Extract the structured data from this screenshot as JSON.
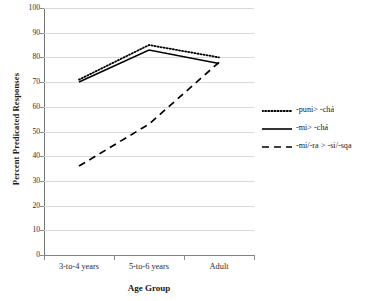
{
  "chart_data": {
    "type": "line",
    "title": "",
    "xlabel": "Age Group",
    "ylabel": "Percent Predicated Responses",
    "categories": [
      "3-to-4 years",
      "5-to-6 years",
      "Adult"
    ],
    "ylim": [
      0,
      100
    ],
    "yticks": [
      0,
      10,
      20,
      30,
      40,
      50,
      60,
      70,
      80,
      90,
      100
    ],
    "grid": true,
    "legend_position": "right",
    "series": [
      {
        "name": "-puni> -chá",
        "style": "dotted",
        "color": "#000000",
        "values": [
          71,
          85,
          80
        ]
      },
      {
        "name": "-mi> -chá",
        "style": "solid",
        "color": "#000000",
        "values": [
          70,
          83,
          77.5
        ]
      },
      {
        "name": "-mi/-ra > -si/-sqa",
        "style": "dashed",
        "color": "#000000",
        "values": [
          36,
          53,
          78
        ]
      }
    ]
  },
  "axis": {
    "y_tick_labels": [
      "100",
      "90",
      "80",
      "70",
      "60",
      "50",
      "40",
      "30",
      "20",
      "10",
      "0"
    ],
    "y_title": "Percent Predicated Responses",
    "x_title": "Age Group",
    "x_tick_labels": [
      "3-to-4 years",
      "5-to-6 years",
      "Adult"
    ]
  },
  "legend": {
    "entries": [
      {
        "label": "-puni> -chá",
        "style": "dotted"
      },
      {
        "label": "-mi> -chá",
        "style": "solid"
      },
      {
        "label": "-mi/-ra > -si/-sqa",
        "style": "dashed"
      }
    ]
  }
}
